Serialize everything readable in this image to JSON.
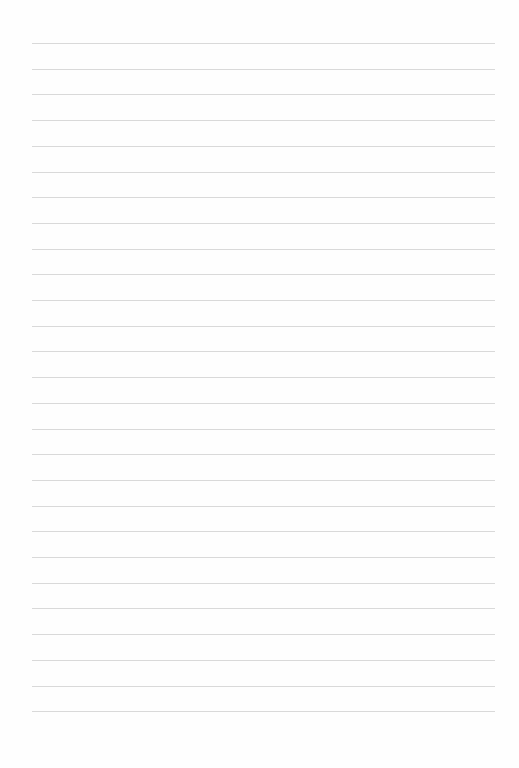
{
  "page": {
    "type": "lined-paper",
    "background_color": "#fefefe",
    "line_color": "#d9d9d9",
    "line_count": 27,
    "first_line_y": 43,
    "line_spacing": 25.7,
    "line_left": 32,
    "line_width": 463
  }
}
